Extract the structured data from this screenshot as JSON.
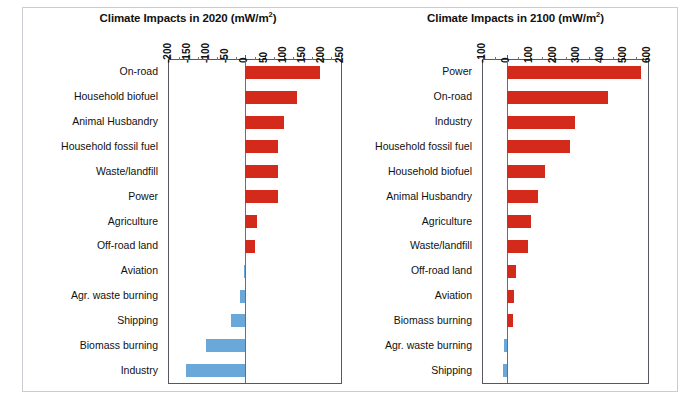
{
  "scan_artifact_text": "",
  "chart_data": [
    {
      "type": "bar",
      "orientation": "horizontal",
      "title": "Climate Impacts in 2020 (mW/m2)",
      "title_main": "Climate Impacts in 2020 (mW/m",
      "title_sup": "2",
      "title_tail": ")",
      "xlabel": "",
      "ylabel": "",
      "xlim": [
        -200,
        250
      ],
      "xticks": [
        -200,
        -150,
        -100,
        -50,
        0,
        50,
        100,
        150,
        200,
        250
      ],
      "xticklabels": [
        "-200",
        "-150",
        "-100",
        "-50",
        "0",
        "50",
        "100",
        "150",
        "200",
        "250"
      ],
      "grid": false,
      "legend": "none",
      "positive_color": "#d42a1c",
      "negative_color": "#69a8d8",
      "categories": [
        "On-road",
        "Household biofuel",
        "Animal Husbandry",
        "Household fossil fuel",
        "Waste/landfill",
        "Power",
        "Agriculture",
        "Off-road land",
        "Aviation",
        "Agr. waste burning",
        "Shipping",
        "Biomass burning",
        "Industry"
      ],
      "values": [
        195,
        136,
        102,
        86,
        86,
        85,
        30,
        25,
        -3,
        -13,
        -39,
        -102,
        -156
      ]
    },
    {
      "type": "bar",
      "orientation": "horizontal",
      "title": "Climate Impacts in 2100 (mW/m2)",
      "title_main": "Climate Impacts in 2100 (mW/m",
      "title_sup": "2",
      "title_tail": ")",
      "xlabel": "",
      "ylabel": "",
      "xlim": [
        -100,
        600
      ],
      "xticks": [
        -100,
        0,
        100,
        200,
        300,
        400,
        500,
        600
      ],
      "xticklabels": [
        "-100",
        "0",
        "100",
        "200",
        "300",
        "400",
        "500",
        "600"
      ],
      "grid": false,
      "legend": "none",
      "positive_color": "#d42a1c",
      "negative_color": "#69a8d8",
      "categories": [
        "Power",
        "On-road",
        "Industry",
        "Household fossil fuel",
        "Household biofuel",
        "Animal Husbandry",
        "Agriculture",
        "Waste/landfill",
        "Off-road land",
        "Aviation",
        "Biomass burning",
        "Agr. waste burning",
        "Shipping"
      ],
      "values": [
        572,
        432,
        289,
        268,
        163,
        134,
        105,
        92,
        42,
        30,
        26,
        -10,
        -14
      ]
    }
  ]
}
